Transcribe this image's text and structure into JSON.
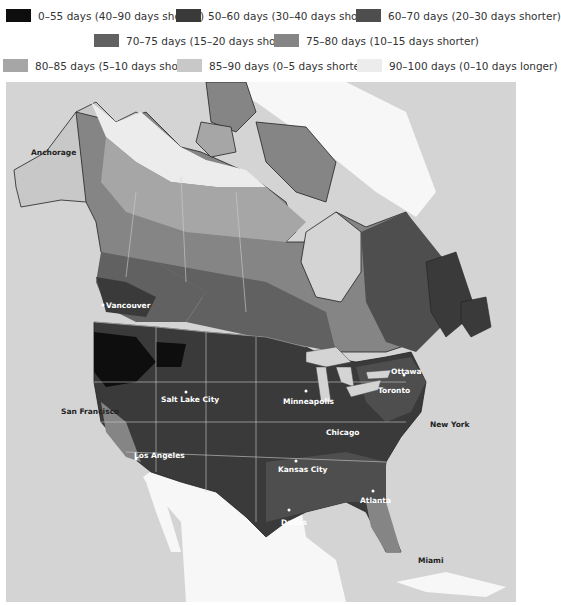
{
  "legend": {
    "items": [
      {
        "label": "0–55 days (40–90 days shorter)",
        "color": "#0e0e0e"
      },
      {
        "label": "50–60 days (30–40 days shorter)",
        "color": "#3a3a3a"
      },
      {
        "label": "60–70 days (20–30 days shorter)",
        "color": "#4e4e4e"
      },
      {
        "label": "70–75 days (15–20 days shorter)",
        "color": "#616161"
      },
      {
        "label": "75–80 days (10–15 days shorter)",
        "color": "#858585"
      },
      {
        "label": "80–85 days (5–10 days shorter)",
        "color": "#a6a6a6"
      },
      {
        "label": "85–90 days (0–5 days shorter)",
        "color": "#c8c8c8"
      },
      {
        "label": "90–100 days (0–10 days longer)",
        "color": "#ececec"
      }
    ]
  },
  "map": {
    "ocean_color": "#d4d4d4",
    "outside_land_color": "#f7f7f7",
    "cities": [
      {
        "name": "Anchorage",
        "style": "dark"
      },
      {
        "name": "Vancouver",
        "style": "light"
      },
      {
        "name": "San Francisco",
        "style": "dark"
      },
      {
        "name": "Salt Lake City",
        "style": "light"
      },
      {
        "name": "Los Angeles",
        "style": "light"
      },
      {
        "name": "Minneapolis",
        "style": "light"
      },
      {
        "name": "Chicago",
        "style": "light"
      },
      {
        "name": "Kansas City",
        "style": "light"
      },
      {
        "name": "Dallas",
        "style": "light"
      },
      {
        "name": "Atlanta",
        "style": "light"
      },
      {
        "name": "Ottawa",
        "style": "light"
      },
      {
        "name": "Toronto",
        "style": "light"
      },
      {
        "name": "New York",
        "style": "dark"
      },
      {
        "name": "Miami",
        "style": "dark"
      }
    ]
  }
}
